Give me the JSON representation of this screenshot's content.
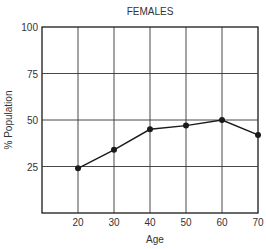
{
  "chart_data": {
    "type": "line",
    "title": "FEMALES",
    "xlabel": "Age",
    "ylabel": "% Population",
    "x": [
      20,
      30,
      40,
      50,
      60,
      70
    ],
    "series": [
      {
        "name": "Females",
        "values": [
          24,
          34,
          45,
          47,
          50,
          42
        ]
      }
    ],
    "xticks": [
      "20",
      "30",
      "40",
      "50",
      "60",
      "70"
    ],
    "yticks": [
      "25",
      "50",
      "75",
      "100"
    ],
    "xlim": [
      10,
      70
    ],
    "ylim": [
      0,
      100
    ],
    "grid": true,
    "legend": "none",
    "marker": "filled-circle",
    "line_color": "#1a1a1a"
  }
}
